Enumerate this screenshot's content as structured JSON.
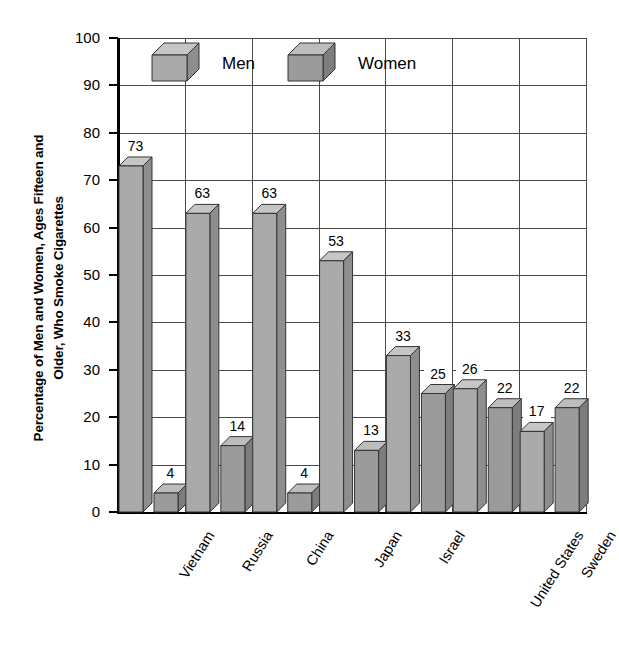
{
  "chart_data": {
    "type": "bar",
    "title": "",
    "subtitle": "",
    "xlabel": "",
    "ylabel": "Percentage of Men and Women, Ages Fifteen and Older, Who Smoke Cigarettes",
    "ylabel_lines": [
      "Percentage of Men and Women, Ages Fifteen and",
      "Older, Who Smoke Cigarettes"
    ],
    "categories": [
      "Vietnam",
      "Russia",
      "China",
      "Japan",
      "Israel",
      "United States",
      "Sweden"
    ],
    "series": [
      {
        "name": "Men",
        "values": [
          73,
          63,
          63,
          53,
          33,
          26,
          17
        ],
        "color": "#aaaaaa"
      },
      {
        "name": "Women",
        "values": [
          4,
          14,
          4,
          13,
          25,
          22,
          22
        ],
        "color": "#9b9b9b"
      }
    ],
    "ylim": [
      0,
      100
    ],
    "yticks": [
      0,
      10,
      20,
      30,
      40,
      50,
      60,
      70,
      80,
      90,
      100
    ],
    "ytick_labels": [
      "0",
      "10",
      "20",
      "30",
      "40",
      "50",
      "60",
      "70",
      "80",
      "90",
      "100"
    ],
    "grid": true,
    "legend_position": "upper-left-inside",
    "style": "3d-bars"
  },
  "legend": {
    "items": [
      {
        "label": "Men",
        "swatch": "light-gray-cube"
      },
      {
        "label": "Women",
        "swatch": "dark-gray-cube"
      }
    ]
  },
  "colors": {
    "men_front": "#aaaaaa",
    "men_top": "#c6c6c6",
    "men_side": "#8e8e8e",
    "women_front": "#9b9b9b",
    "women_top": "#bdbdbd",
    "women_side": "#7d7d7d",
    "grid": "#4a4a4a",
    "axis": "#000000",
    "background": "#ffffff"
  }
}
